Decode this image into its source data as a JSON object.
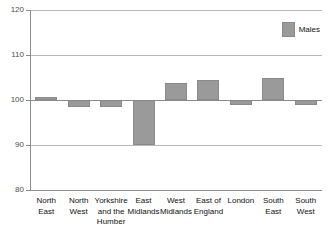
{
  "chart_data": {
    "type": "bar",
    "title": "",
    "xlabel": "",
    "ylabel": "",
    "ylim": [
      80,
      120
    ],
    "yticks": [
      80,
      90,
      100,
      110,
      120
    ],
    "ytick_labels": [
      "80",
      "90",
      "100",
      "110",
      "120"
    ],
    "grid": true,
    "baseline": 100,
    "legend": {
      "position": "top-right",
      "entries": [
        {
          "label": "Males",
          "color": "#9a9a9a"
        }
      ]
    },
    "categories": [
      "North East",
      "North West",
      "Yorkshire and the Humber",
      "East Midlands",
      "West Midlands",
      "East of England",
      "London",
      "South East",
      "South West"
    ],
    "category_lines": [
      [
        "North",
        "East"
      ],
      [
        "North",
        "West"
      ],
      [
        "Yorkshire",
        "and the",
        "Humber"
      ],
      [
        "East",
        "Midlands"
      ],
      [
        "West",
        "Midlands"
      ],
      [
        "East of",
        "England"
      ],
      [
        "London"
      ],
      [
        "South",
        "East"
      ],
      [
        "South",
        "West"
      ]
    ],
    "series": [
      {
        "name": "Males",
        "color": "#9a9a9a",
        "values": [
          100.7,
          98.5,
          98.5,
          90.0,
          103.8,
          104.5,
          99.0,
          105.0,
          99.0
        ]
      }
    ]
  },
  "colors": {
    "bar": "#9a9a9a",
    "bar_border": "#8a8a8a",
    "gridline": "#b9b9b9",
    "axis": "#8c8c8c",
    "tick_text": "#4d4d4d",
    "label_text": "#111111",
    "background": "#ffffff"
  }
}
